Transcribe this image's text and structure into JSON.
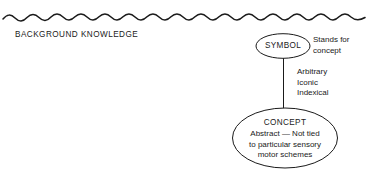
{
  "figure": {
    "background_color": "#ffffff",
    "stroke_color": "#1a1a1a",
    "divider": {
      "name": "wavy-divider",
      "style": "hand-drawn wavy horizontal rule"
    },
    "background_label": "BACKGROUND KNOWLEDGE",
    "nodes": [
      {
        "id": "symbol",
        "shape": "ellipse",
        "title": "SYMBOL"
      },
      {
        "id": "concept",
        "shape": "ellipse",
        "title": "CONCEPT",
        "body_lines": [
          "Abstract — Not tied",
          "to particular sensory",
          "motor schemes"
        ]
      }
    ],
    "annotations": {
      "symbol_relation": [
        "Stands for",
        "concept"
      ],
      "link_qualifiers": [
        "Arbitrary",
        "Iconic",
        "Indexical"
      ]
    },
    "connector": {
      "name": "symbol-concept-link",
      "from": "symbol",
      "to": "concept"
    }
  }
}
